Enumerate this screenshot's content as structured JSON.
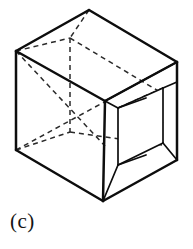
{
  "figure": {
    "caption": "(c)",
    "background_color": "#ffffff",
    "line_color": "#0d0d0d",
    "hidden_line_color": "#2a2a2a",
    "stroke_widths": {
      "solid_main": 2.5,
      "solid_inner": 1.7,
      "hidden": 1.5
    },
    "hidden_line_dash": "5 4",
    "geometry": {
      "outer_silhouette": [
        [
          89,
          10
        ],
        [
          177,
          62
        ],
        [
          177,
          160
        ],
        [
          103,
          201
        ],
        [
          16,
          150
        ],
        [
          16,
          51
        ]
      ],
      "front_center_vertex": [
        105,
        101
      ],
      "back_hidden_top_vertex": [
        70,
        38
      ],
      "back_hidden_bottom_vertex": [
        57,
        128
      ],
      "recess_near_top": [
        118,
        108
      ],
      "recess_near_bottom": [
        118,
        165
      ],
      "recess_far_top": [
        163,
        88
      ],
      "recess_far_bottom": [
        163,
        143
      ],
      "recess_inner_top": [
        146,
        98
      ],
      "recess_inner_bottom": [
        146,
        155
      ]
    }
  }
}
